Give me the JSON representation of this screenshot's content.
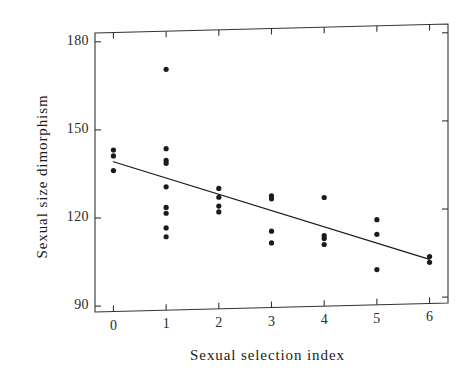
{
  "chart_data": {
    "type": "scatter",
    "title": "",
    "xlabel": "Sexual selection index",
    "ylabel": "Sexual size dimorphism",
    "xlim": [
      -0.35,
      6.35
    ],
    "ylim": [
      88,
      183
    ],
    "xticks": [
      0,
      1,
      2,
      3,
      4,
      5,
      6
    ],
    "xtick_labels": [
      "0",
      "1",
      "2",
      "3",
      "4",
      "5",
      "6"
    ],
    "yticks": [
      90,
      120,
      150,
      180
    ],
    "ytick_labels": [
      "90",
      "120",
      "150",
      "180"
    ],
    "grid": false,
    "legend": false,
    "marker": "filled-circle",
    "marker_color": "#1b1b1b",
    "line_color": "#1b1b1b",
    "frame": "box",
    "points": [
      {
        "x": 0,
        "y": 143
      },
      {
        "x": 0,
        "y": 141
      },
      {
        "x": 0,
        "y": 136
      },
      {
        "x": 1,
        "y": 170
      },
      {
        "x": 1,
        "y": 143
      },
      {
        "x": 1,
        "y": 139
      },
      {
        "x": 1,
        "y": 138
      },
      {
        "x": 1,
        "y": 130
      },
      {
        "x": 1,
        "y": 123
      },
      {
        "x": 1,
        "y": 121
      },
      {
        "x": 1,
        "y": 116
      },
      {
        "x": 1,
        "y": 113
      },
      {
        "x": 2,
        "y": 129
      },
      {
        "x": 2,
        "y": 126
      },
      {
        "x": 2,
        "y": 123
      },
      {
        "x": 2,
        "y": 121
      },
      {
        "x": 3,
        "y": 126
      },
      {
        "x": 3,
        "y": 125
      },
      {
        "x": 3,
        "y": 114
      },
      {
        "x": 3,
        "y": 110
      },
      {
        "x": 4,
        "y": 125
      },
      {
        "x": 4,
        "y": 112
      },
      {
        "x": 4,
        "y": 111
      },
      {
        "x": 4,
        "y": 109
      },
      {
        "x": 5,
        "y": 117
      },
      {
        "x": 5,
        "y": 112
      },
      {
        "x": 5,
        "y": 100
      },
      {
        "x": 6,
        "y": 104
      },
      {
        "x": 6,
        "y": 102
      }
    ],
    "trendline": {
      "x_start": 0,
      "y_start": 139,
      "x_end": 6,
      "y_end": 103
    }
  }
}
